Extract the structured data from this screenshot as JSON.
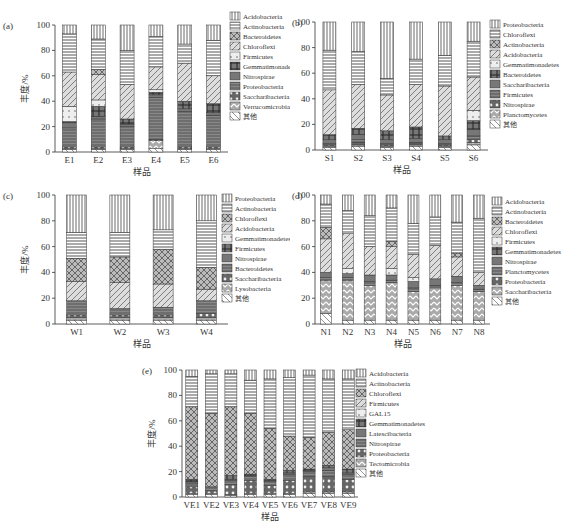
{
  "figure": {
    "ylabel": "丰度/%",
    "xlabel": "样品",
    "yticks": [
      0,
      20,
      40,
      60,
      80,
      100
    ]
  },
  "chart_data": [
    {
      "panel": "(a)",
      "type": "bar",
      "stacked": true,
      "xlabel": "样品",
      "ylabel": "丰度/%",
      "ylim": [
        0,
        100
      ],
      "categories": [
        "E1",
        "E2",
        "E3",
        "E4",
        "E5",
        "E6"
      ],
      "legend": [
        "Acidobacteria",
        "Actinobacteria",
        "Bacteroidetes",
        "Chloroflexi",
        "Firmicutes",
        "Gemmatimonadetes",
        "Nitrospirae",
        "Proteobacteria",
        "Saccharibacteria",
        "Verrucomicrobia",
        "其他"
      ],
      "series": [
        {
          "name": "其他",
          "values": [
            2,
            2,
            2,
            3,
            2,
            2
          ]
        },
        {
          "name": "Verrucomicrobia",
          "values": [
            1,
            1,
            1,
            6,
            1,
            1
          ]
        },
        {
          "name": "Saccharibacteria",
          "values": [
            1,
            1,
            1,
            1,
            1,
            1
          ]
        },
        {
          "name": "Proteobacteria",
          "values": [
            15,
            22,
            16,
            33,
            28,
            25
          ]
        },
        {
          "name": "Nitrospirae",
          "values": [
            4,
            2,
            2,
            2,
            2,
            2
          ]
        },
        {
          "name": "Gemmatimonadetes",
          "values": [
            1,
            8,
            4,
            2,
            6,
            7
          ]
        },
        {
          "name": "Firmicutes",
          "values": [
            12,
            5,
            0,
            2,
            0,
            0
          ]
        },
        {
          "name": "Chloroflexi",
          "values": [
            27,
            20,
            27,
            18,
            30,
            22
          ]
        },
        {
          "name": "Bacteroidetes",
          "values": [
            0,
            4,
            0,
            0,
            0,
            0
          ]
        },
        {
          "name": "Actinobacteria",
          "values": [
            30,
            24,
            27,
            24,
            15,
            28
          ]
        },
        {
          "name": "Acidobacteria",
          "values": [
            7,
            11,
            20,
            9,
            15,
            12
          ]
        }
      ]
    },
    {
      "panel": "(b)",
      "type": "bar",
      "stacked": true,
      "xlabel": "样品",
      "ylabel": "丰度/%",
      "ylim": [
        0,
        100
      ],
      "categories": [
        "S1",
        "S2",
        "S3",
        "S4",
        "S5",
        "S6"
      ],
      "legend": [
        "Proteobacteria",
        "Chloroflexi",
        "Actinobacteria",
        "Acidobacteria",
        "Gemmatimonadetes",
        "Bacteroidetes",
        "Saccharibacteria",
        "Firmicutes",
        "Nitrospirae",
        "Planctomycetes",
        "其他"
      ],
      "series": [
        {
          "name": "其他",
          "values": [
            2,
            3,
            2,
            3,
            2,
            4
          ]
        },
        {
          "name": "Planctomycetes",
          "values": [
            1,
            1,
            1,
            1,
            1,
            2
          ]
        },
        {
          "name": "Nitrospirae",
          "values": [
            1,
            2,
            1,
            1,
            1,
            2
          ]
        },
        {
          "name": "Firmicutes",
          "values": [
            1,
            2,
            1,
            1,
            1,
            3
          ]
        },
        {
          "name": "Saccharibacteria",
          "values": [
            3,
            4,
            3,
            3,
            3,
            5
          ]
        },
        {
          "name": "Bacteroidetes",
          "values": [
            4,
            5,
            7,
            9,
            3,
            7
          ]
        },
        {
          "name": "Gemmatimonadetes",
          "values": [
            0,
            0,
            0,
            0,
            0,
            8
          ]
        },
        {
          "name": "Acidobacteria",
          "values": [
            35,
            34,
            28,
            33,
            39,
            26
          ]
        },
        {
          "name": "Actinobacteria",
          "values": [
            0,
            0,
            0,
            0,
            0,
            0
          ]
        },
        {
          "name": "Chloroflexi",
          "values": [
            31,
            26,
            13,
            20,
            24,
            28
          ]
        },
        {
          "name": "Proteobacteria",
          "values": [
            22,
            23,
            44,
            29,
            26,
            15
          ]
        }
      ]
    },
    {
      "panel": "(c)",
      "type": "bar",
      "stacked": true,
      "xlabel": "样品",
      "ylabel": "丰度/%",
      "ylim": [
        0,
        100
      ],
      "categories": [
        "W1",
        "W2",
        "W3",
        "W4"
      ],
      "legend": [
        "Proteobacteria",
        "Actinobacteria",
        "Chloroflexi",
        "Acidobacteria",
        "Gemmatimonadetes",
        "Firmicutes",
        "Nitrospirae",
        "Bacteroidetes",
        "Saccharibacteria",
        "Lysobacteria",
        "其他"
      ],
      "series": [
        {
          "name": "其他",
          "values": [
            3,
            3,
            3,
            3
          ]
        },
        {
          "name": "Lysobacteria",
          "values": [
            2,
            2,
            2,
            2
          ]
        },
        {
          "name": "Saccharibacteria",
          "values": [
            2,
            2,
            2,
            3
          ]
        },
        {
          "name": "Bacteroidetes",
          "values": [
            11,
            5,
            6,
            10
          ]
        },
        {
          "name": "Nitrospirae",
          "values": [
            0,
            0,
            0,
            0
          ]
        },
        {
          "name": "Firmicutes",
          "values": [
            0,
            0,
            0,
            0
          ]
        },
        {
          "name": "Gemmatimonadetes",
          "values": [
            0,
            0,
            0,
            0
          ]
        },
        {
          "name": "Acidobacteria",
          "values": [
            15,
            20,
            18,
            9
          ]
        },
        {
          "name": "Chloroflexi",
          "values": [
            18,
            20,
            27,
            17
          ]
        },
        {
          "name": "Actinobacteria",
          "values": [
            20,
            19,
            15,
            36
          ]
        },
        {
          "name": "Proteobacteria",
          "values": [
            29,
            29,
            27,
            20
          ]
        }
      ]
    },
    {
      "panel": "(d)",
      "type": "bar",
      "stacked": true,
      "xlabel": "样品",
      "ylabel": "丰度/%",
      "ylim": [
        0,
        100
      ],
      "categories": [
        "N1",
        "N2",
        "N3",
        "N4",
        "N5",
        "N6",
        "N7",
        "N8"
      ],
      "legend": [
        "Acidobacteria",
        "Actinobacteria",
        "Bacteroidetes",
        "Chloroflexi",
        "Firmicutes",
        "Gemmatimonadetes",
        "Nitrospirae",
        "Planctomycetes",
        "Proteobacteria",
        "Saccharibacteria",
        "其他"
      ],
      "series": [
        {
          "name": "其他",
          "values": [
            8,
            3,
            3,
            3,
            3,
            3,
            3,
            3
          ]
        },
        {
          "name": "Saccharibacteria",
          "values": [
            26,
            31,
            27,
            29,
            22,
            25,
            27,
            22
          ]
        },
        {
          "name": "Proteobacteria",
          "values": [
            0,
            0,
            0,
            0,
            0,
            0,
            0,
            0
          ]
        },
        {
          "name": "Planctomycetes",
          "values": [
            2,
            2,
            3,
            2,
            3,
            2,
            2,
            2
          ]
        },
        {
          "name": "Nitrospirae",
          "values": [
            4,
            3,
            5,
            4,
            5,
            5,
            5,
            3
          ]
        },
        {
          "name": "Gemmatimonadetes",
          "values": [
            0,
            0,
            0,
            0,
            0,
            0,
            0,
            0
          ]
        },
        {
          "name": "Firmicutes",
          "values": [
            0,
            4,
            0,
            5,
            3,
            0,
            0,
            0
          ]
        },
        {
          "name": "Chloroflexi",
          "values": [
            26,
            27,
            22,
            17,
            18,
            26,
            15,
            10
          ]
        },
        {
          "name": "Bacteroidetes",
          "values": [
            9,
            0,
            0,
            4,
            0,
            0,
            3,
            0
          ]
        },
        {
          "name": "Actinobacteria",
          "values": [
            18,
            18,
            24,
            26,
            24,
            22,
            24,
            42
          ]
        },
        {
          "name": "Acidobacteria",
          "values": [
            7,
            12,
            16,
            10,
            22,
            17,
            21,
            18
          ]
        }
      ]
    },
    {
      "panel": "(e)",
      "type": "bar",
      "stacked": true,
      "xlabel": "样品",
      "ylabel": "丰度/%",
      "ylim": [
        0,
        100
      ],
      "categories": [
        "VE1",
        "VE2",
        "VE3",
        "VE4",
        "VE5",
        "VE6",
        "VE7",
        "VE8",
        "VE9"
      ],
      "legend": [
        "Acidobacteria",
        "Actinobacteria",
        "Chloroflexi",
        "Firmicutes",
        "GAL15",
        "Gemmatimonadetes",
        "Latescibacteria",
        "Nitrospirae",
        "Proteobacteria",
        "Tectomicrobia",
        "其他"
      ],
      "series": [
        {
          "name": "其他",
          "values": [
            2,
            2,
            1,
            2,
            2,
            2,
            3,
            3,
            3
          ]
        },
        {
          "name": "Tectomicrobia",
          "values": [
            1,
            1,
            1,
            1,
            1,
            1,
            1,
            1,
            1
          ]
        },
        {
          "name": "Proteobacteria",
          "values": [
            5,
            2,
            8,
            10,
            6,
            10,
            12,
            12,
            10
          ]
        },
        {
          "name": "Nitrospirae",
          "values": [
            3,
            3,
            3,
            3,
            3,
            5,
            4,
            5,
            4
          ]
        },
        {
          "name": "Latescibacteria",
          "values": [
            1,
            0,
            1,
            1,
            1,
            1,
            1,
            2,
            1
          ]
        },
        {
          "name": "Gemmatimonadetes",
          "values": [
            2,
            0,
            3,
            1,
            1,
            2,
            1,
            2,
            3
          ]
        },
        {
          "name": "GAL15",
          "values": [
            0,
            0,
            0,
            0,
            0,
            0,
            0,
            0,
            0
          ]
        },
        {
          "name": "Firmicutes",
          "values": [
            0,
            0,
            0,
            0,
            0,
            0,
            0,
            0,
            0
          ]
        },
        {
          "name": "Chloroflexi",
          "values": [
            57,
            58,
            54,
            48,
            40,
            27,
            25,
            26,
            31
          ]
        },
        {
          "name": "Actinobacteria",
          "values": [
            24,
            31,
            26,
            26,
            39,
            46,
            49,
            42,
            40
          ]
        },
        {
          "name": "Acidobacteria",
          "values": [
            5,
            3,
            3,
            8,
            7,
            6,
            4,
            7,
            7
          ]
        }
      ]
    }
  ]
}
